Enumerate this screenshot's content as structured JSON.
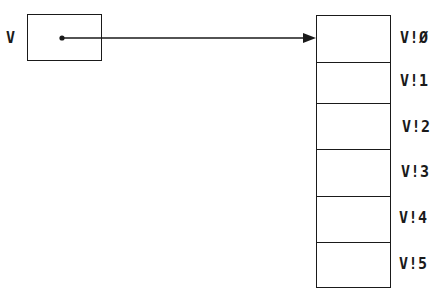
{
  "diagram": {
    "pointer": {
      "label": "V",
      "has_dot": true
    },
    "vector": {
      "cells": [
        {
          "label": "V!Ø"
        },
        {
          "label": "V!1"
        },
        {
          "label": "V!2"
        },
        {
          "label": "V!3"
        },
        {
          "label": "V!4"
        },
        {
          "label": "V!5"
        }
      ]
    },
    "arrow": {
      "from": "pointer",
      "to": "vector.cells.0"
    },
    "colors": {
      "ink": "#1a1a1a",
      "background": "#ffffff"
    }
  }
}
